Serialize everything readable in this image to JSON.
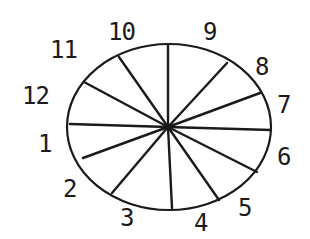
{
  "diagram": {
    "type": "radial-segmented-ellipse",
    "stroke_color": "#1a1a1a",
    "faded_label_color": "#9a9a9a",
    "center": [
      168,
      127
    ],
    "ellipse": {
      "cx": 169,
      "cy": 127,
      "rx": 102,
      "ry": 83
    },
    "spokes": [
      {
        "to": [
          168,
          45
        ]
      },
      {
        "to": [
          227,
          63
        ]
      },
      {
        "to": [
          260,
          93
        ]
      },
      {
        "to": [
          271,
          130
        ]
      },
      {
        "to": [
          257,
          172
        ]
      },
      {
        "to": [
          219,
          200
        ]
      },
      {
        "to": [
          172,
          208
        ]
      },
      {
        "to": [
          112,
          193
        ]
      },
      {
        "to": [
          83,
          158
        ]
      },
      {
        "to": [
          70,
          124
        ]
      },
      {
        "to": [
          84,
          82
        ]
      },
      {
        "to": [
          119,
          57
        ]
      }
    ],
    "labels": [
      {
        "text": "10",
        "x": 108,
        "y": 40
      },
      {
        "text": "9",
        "x": 203,
        "y": 40
      },
      {
        "text": "8",
        "x": 255,
        "y": 75
      },
      {
        "text": "7",
        "x": 277,
        "y": 113
      },
      {
        "text": "6",
        "x": 277,
        "y": 165
      },
      {
        "text": "5",
        "x": 238,
        "y": 216
      },
      {
        "text": "4",
        "x": 194,
        "y": 231
      },
      {
        "text": "3",
        "x": 120,
        "y": 226,
        "faded": true
      },
      {
        "text": "2",
        "x": 63,
        "y": 197
      },
      {
        "text": "1",
        "x": 38,
        "y": 152
      },
      {
        "text": "12",
        "x": 22,
        "y": 104
      },
      {
        "text": "11",
        "x": 50,
        "y": 58
      }
    ]
  }
}
